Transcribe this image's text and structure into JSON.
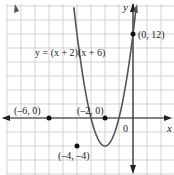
{
  "chart_data": {
    "type": "line",
    "title": "",
    "equation": "y = (x + 2)(x + 6)",
    "xlabel": "x",
    "ylabel": "y",
    "origin_label": "0",
    "grid": true,
    "grid_step": 2,
    "xlim": [
      -9.5,
      5.5
    ],
    "ylim": [
      -8,
      16
    ],
    "series": [
      {
        "name": "y = (x + 2)(x + 6)",
        "function": "(x+2)*(x+6)",
        "color": "#555555"
      }
    ],
    "points": [
      {
        "x": 0,
        "y": 12,
        "label": "(0, 12)"
      },
      {
        "x": -6,
        "y": 0,
        "label": "(–6, 0)"
      },
      {
        "x": -2,
        "y": 0,
        "label": "(–2, 0)"
      },
      {
        "x": -4,
        "y": -4,
        "label": "(–4, –4)"
      }
    ]
  },
  "colors": {
    "grid": "#c8c8c8",
    "axis": "#222222",
    "curve": "#555555",
    "point": "#111111"
  }
}
